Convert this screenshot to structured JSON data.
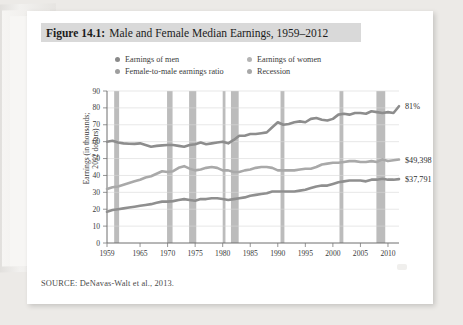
{
  "figure": {
    "label": "Figure 14.1:",
    "title": "Male and Female Median Earnings, 1959–2012",
    "source": "SOURCE: DeNavas-Walt et al., 2013."
  },
  "legend": {
    "position": "top-center",
    "items": [
      {
        "label": "Earnings of men",
        "color": "#8a8a8a",
        "icon": "legend-dot-icon"
      },
      {
        "label": "Earnings of women",
        "color": "#b4b4b4",
        "icon": "legend-dot-icon"
      },
      {
        "label": "Female-to-male earnings ratio",
        "color": "#9e9e9e",
        "icon": "legend-dot-icon"
      },
      {
        "label": "Recession",
        "color": "#a8a8a8",
        "icon": "legend-dot-icon"
      }
    ]
  },
  "annotations": [
    {
      "name": "ratio-end-label",
      "text": "81%",
      "year": 2012,
      "value": 81.0
    },
    {
      "name": "men-end-label",
      "text": "$49,398",
      "year": 2012,
      "value": 49.398
    },
    {
      "name": "women-end-label",
      "text": "$37,791",
      "year": 2012,
      "value": 37.791
    }
  ],
  "chart_data": {
    "type": "line",
    "title": "Male and Female Median Earnings, 1959–2012",
    "xlabel": "",
    "ylabel": "Earnings (in thousands;\n2012 dollars)",
    "xlim": [
      1959,
      2012
    ],
    "ylim": [
      0,
      90
    ],
    "yticks": [
      0,
      10,
      20,
      30,
      40,
      50,
      60,
      70,
      80,
      90
    ],
    "xticks": [
      1959,
      1965,
      1970,
      1975,
      1980,
      1985,
      1990,
      1995,
      2000,
      2005,
      2010
    ],
    "grid": "horizontal",
    "x": [
      1959,
      1960,
      1961,
      1962,
      1963,
      1964,
      1965,
      1966,
      1967,
      1968,
      1969,
      1970,
      1971,
      1972,
      1973,
      1974,
      1975,
      1976,
      1977,
      1978,
      1979,
      1980,
      1981,
      1982,
      1983,
      1984,
      1985,
      1986,
      1987,
      1988,
      1989,
      1990,
      1991,
      1992,
      1993,
      1994,
      1995,
      1996,
      1997,
      1998,
      1999,
      2000,
      2001,
      2002,
      2003,
      2004,
      2005,
      2006,
      2007,
      2008,
      2009,
      2010,
      2011,
      2012
    ],
    "series": [
      {
        "name": "Female-to-male earnings ratio",
        "unit": "percent",
        "color": "#8d8d8d",
        "values": [
          60.0,
          60.5,
          59.5,
          59.0,
          58.8,
          58.7,
          59.0,
          58.0,
          57.0,
          57.5,
          57.8,
          58.0,
          58.0,
          57.5,
          57.0,
          58.0,
          58.5,
          59.5,
          58.5,
          59.0,
          59.5,
          60.0,
          59.0,
          61.0,
          63.5,
          63.5,
          64.5,
          64.5,
          65.0,
          65.5,
          68.5,
          71.5,
          70.0,
          70.5,
          71.5,
          72.0,
          71.5,
          73.5,
          74.0,
          73.0,
          72.5,
          73.5,
          76.0,
          76.5,
          76.0,
          77.0,
          77.0,
          76.5,
          78.0,
          77.5,
          77.0,
          77.5,
          77.0,
          81.0
        ]
      },
      {
        "name": "Earnings of men",
        "unit": "thousands of 2012 dollars",
        "color": "#a9a9a9",
        "values": [
          32.0,
          33.0,
          33.5,
          34.5,
          35.5,
          36.5,
          37.5,
          38.8,
          39.5,
          41.0,
          42.5,
          42.0,
          42.5,
          44.5,
          45.5,
          44.0,
          43.0,
          43.5,
          44.5,
          45.0,
          44.5,
          43.0,
          43.0,
          42.0,
          42.0,
          43.0,
          43.5,
          44.5,
          45.0,
          45.0,
          44.5,
          43.0,
          43.0,
          43.0,
          43.0,
          43.5,
          44.0,
          44.0,
          45.0,
          46.5,
          47.0,
          47.5,
          47.5,
          48.0,
          48.5,
          48.5,
          48.0,
          48.0,
          48.5,
          48.0,
          49.5,
          48.5,
          49.0,
          49.4
        ]
      },
      {
        "name": "Earnings of women",
        "unit": "thousands of 2012 dollars",
        "color": "#8f8f8f",
        "values": [
          18.5,
          19.5,
          20.0,
          20.5,
          21.0,
          21.5,
          22.0,
          22.5,
          23.0,
          23.8,
          24.5,
          24.5,
          24.8,
          25.5,
          26.0,
          25.5,
          25.0,
          26.0,
          26.0,
          26.5,
          26.5,
          26.0,
          25.5,
          26.0,
          26.5,
          27.0,
          28.0,
          28.5,
          29.0,
          29.5,
          30.5,
          30.5,
          30.5,
          30.5,
          30.5,
          31.0,
          31.5,
          32.5,
          33.5,
          34.0,
          34.0,
          35.0,
          36.0,
          36.5,
          37.0,
          37.0,
          37.0,
          36.5,
          37.5,
          37.5,
          38.0,
          37.5,
          37.5,
          37.8
        ]
      }
    ],
    "recessions": [
      {
        "start": 1960.3,
        "end": 1961.2
      },
      {
        "start": 1969.9,
        "end": 1970.9
      },
      {
        "start": 1973.9,
        "end": 1975.2
      },
      {
        "start": 1980.0,
        "end": 1980.5
      },
      {
        "start": 1981.5,
        "end": 1982.9
      },
      {
        "start": 1990.5,
        "end": 1991.2
      },
      {
        "start": 2001.2,
        "end": 2001.9
      },
      {
        "start": 2007.9,
        "end": 2009.5
      }
    ],
    "recession_color": "#a6a6a6"
  }
}
